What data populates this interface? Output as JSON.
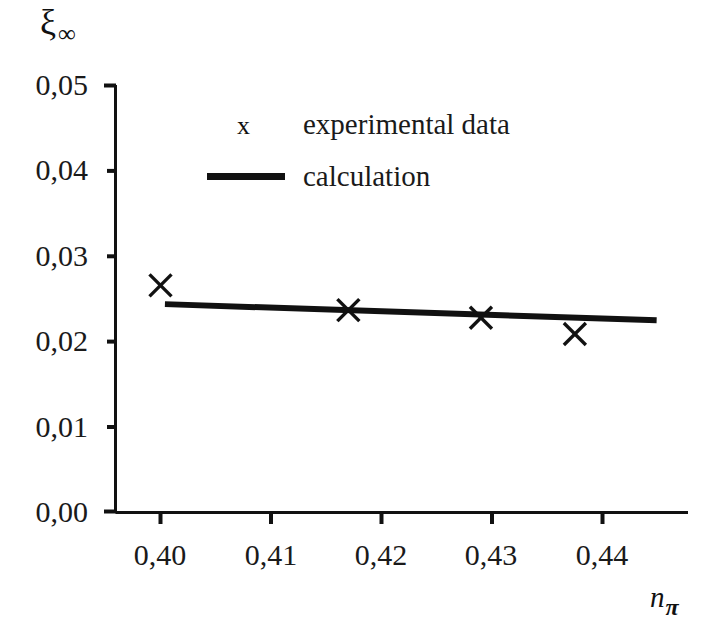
{
  "chart_data": {
    "type": "scatter",
    "title": "",
    "subtitle": "",
    "xlabel": "n_pi",
    "xlabel_base": "n",
    "xlabel_sub": "π",
    "ylabel": "xi_infinity",
    "ylabel_base": "ξ",
    "ylabel_sub": "∞",
    "xlim": [
      0.395,
      0.4445
    ],
    "ylim": [
      0.0,
      0.05
    ],
    "xticks": [
      0.4,
      0.41,
      0.42,
      0.43,
      0.44
    ],
    "yticks": [
      0.0,
      0.01,
      0.02,
      0.03,
      0.04,
      0.05
    ],
    "xticklabels": [
      "0,40",
      "0,41",
      "0,42",
      "0,43",
      "0,44"
    ],
    "yticklabels": [
      "0,00",
      "0,01",
      "0,02",
      "0,03",
      "0,04",
      "0,05"
    ],
    "decimal_separator": ",",
    "grid": false,
    "legend_position": "upper-center-left",
    "axis_color": "#111111",
    "series": [
      {
        "name": "experimental data",
        "type": "scatter",
        "marker": "x",
        "color": "#111111",
        "x": [
          0.4,
          0.417,
          0.429,
          0.4375
        ],
        "y": [
          0.0265,
          0.0236,
          0.0227,
          0.0208
        ]
      },
      {
        "name": "calculation",
        "type": "line",
        "color": "#111111",
        "linewidth": 6,
        "x": [
          0.4004,
          0.4449
        ],
        "y": [
          0.0243,
          0.0224
        ]
      }
    ]
  },
  "legend": {
    "entries": [
      {
        "label": "experimental data",
        "marker": "x",
        "swatch": "marker"
      },
      {
        "label": "calculation",
        "marker": "line",
        "swatch": "line"
      }
    ]
  }
}
